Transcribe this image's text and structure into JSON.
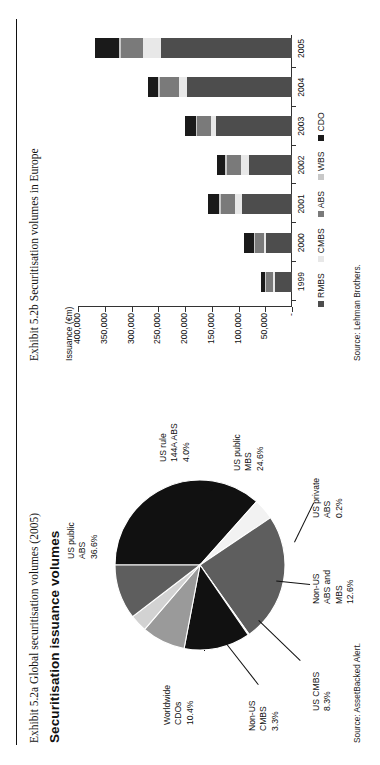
{
  "page": {
    "exhibit_a_caption": "Exhibit 5.2a  Global securitisation volumes (2005)",
    "exhibit_b_caption": "Exhibit 5.2b  Securitisation volumes in Europe",
    "section_title": "Securitisation issuance volumes",
    "source_a": "Source: AssetBacked Alert.",
    "source_b": "Source: Lehman Brothers."
  },
  "chart_data": [
    {
      "type": "pie",
      "title": "Global securitisation volumes (2005)",
      "legend_position": "callout-labels",
      "labels": [
        "US public ABS",
        "US rule 144A ABS",
        "US public MBS",
        "US private ABS",
        "Non-US ABS and MBS",
        "US CMBS",
        "Non-US CMBS",
        "Worldwide CDOs"
      ],
      "values": [
        36.6,
        4.0,
        24.6,
        0.2,
        12.6,
        8.3,
        3.3,
        10.4
      ],
      "value_labels": [
        "36.6%",
        "4.0%",
        "24.6%",
        "0.2%",
        "12.6%",
        "8.3%",
        "3.3%",
        "10.4%"
      ],
      "colors": [
        "#111111",
        "#f2f2f2",
        "#5e5e5e",
        "#ffffff",
        "#111111",
        "#9a9a9a",
        "#d2d2d2",
        "#5e5e5e"
      ],
      "slices": [
        {
          "name": "US public ABS",
          "percent": 36.6,
          "label_l1": "US public",
          "label_l2": "ABS",
          "label_l3": "36.6%"
        },
        {
          "name": "US rule 144A ABS",
          "percent": 4.0,
          "label_l1": "US rule",
          "label_l2": "144A ABS",
          "label_l3": "4.0%"
        },
        {
          "name": "US public MBS",
          "percent": 24.6,
          "label_l1": "US public",
          "label_l2": "MBS",
          "label_l3": "24.6%"
        },
        {
          "name": "US private ABS",
          "percent": 0.2,
          "label_l1": "US private",
          "label_l2": "ABS",
          "label_l3": "0.2%"
        },
        {
          "name": "Non-US ABS and MBS",
          "percent": 12.6,
          "label_l1": "Non-US",
          "label_l2": "ABS and",
          "label_l3": "MBS",
          "label_l4": "12.6%"
        },
        {
          "name": "US CMBS",
          "percent": 8.3,
          "label_l1": "US CMBS",
          "label_l2": "8.3%"
        },
        {
          "name": "Non-US CMBS",
          "percent": 3.3,
          "label_l1": "Non-US",
          "label_l2": "CMBS",
          "label_l3": "3.3%"
        },
        {
          "name": "Worldwide CDOs",
          "percent": 10.4,
          "label_l1": "Worldwide",
          "label_l2": "CDOs",
          "label_l3": "10.4%"
        }
      ]
    },
    {
      "type": "bar",
      "subtype": "stacked",
      "title": "Securitisation volumes in Europe",
      "ylabel": "Issuance (€m)",
      "xlabel": "",
      "categories": [
        "1999",
        "2000",
        "2001",
        "2002",
        "2003",
        "2004",
        "2005"
      ],
      "yticks": [
        "-",
        "50,000",
        "100,000",
        "150,000",
        "200,000",
        "250,000",
        "300,000",
        "350,000",
        "400,000"
      ],
      "ylim": [
        0,
        400000
      ],
      "grid": false,
      "legend_position": "bottom",
      "series": [
        {
          "name": "RMBS",
          "color": "#4d4d4d",
          "values": [
            31000,
            48000,
            93000,
            80000,
            143000,
            197000,
            245000
          ]
        },
        {
          "name": "CMBS",
          "color": "#e8e8e8",
          "values": [
            4000,
            5000,
            13000,
            16000,
            8000,
            14000,
            34000
          ]
        },
        {
          "name": "ABS",
          "color": "#7a7a7a",
          "values": [
            13000,
            16000,
            26000,
            26000,
            26000,
            36000,
            40000
          ]
        },
        {
          "name": "WBS",
          "color": "#c8c8c8",
          "values": [
            2000,
            3000,
            4000,
            4000,
            3000,
            3000,
            4000
          ]
        },
        {
          "name": "CDO",
          "color": "#1a1a1a",
          "values": [
            8000,
            17000,
            22000,
            14000,
            21000,
            19000,
            45000
          ]
        }
      ],
      "totals": [
        58000,
        89000,
        158000,
        140000,
        201000,
        269000,
        368000
      ]
    }
  ]
}
